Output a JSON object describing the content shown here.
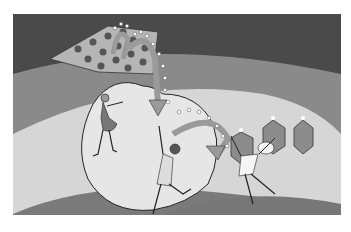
{
  "image": {
    "description": "Grayscale illustration of three dancers on a stage with a heart-shaped floor, a polka-dot flag, arrows with dotted light trails and hexagonal lanterns",
    "colors": {
      "background": "#ffffff",
      "dark_band": "#4a4a4a",
      "mid_band": "#8a8a8a",
      "light_stage": "#d9d9d9",
      "heart": "#e6e6e6",
      "floor": "#7a7a7a",
      "arrow": "#9a9a9a",
      "hexagon": "#8c8c8c"
    }
  }
}
